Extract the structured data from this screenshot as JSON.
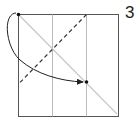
{
  "diagram": {
    "type": "origami-fold-step",
    "step_number": "3",
    "colors": {
      "outline": "#555555",
      "crease": "#bbbbbb",
      "diagonal": "#c8c8c8",
      "dashed_fold": "#333333",
      "arrow": "#222222"
    }
  }
}
